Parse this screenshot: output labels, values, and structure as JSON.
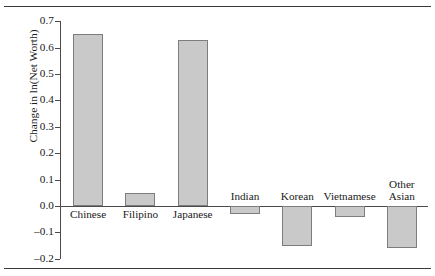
{
  "chart_data": {
    "type": "bar",
    "title": "",
    "subtitle": "",
    "xlabel": "",
    "ylabel": "Change in ln(Net Worth)",
    "categories": [
      "Chinese",
      "Filipino",
      "Japanese",
      "Indian",
      "Korean",
      "Vietnamese",
      "Other Asian"
    ],
    "values": [
      0.65,
      0.05,
      0.63,
      -0.03,
      -0.15,
      -0.04,
      -0.16
    ],
    "ylim": [
      -0.2,
      0.7
    ],
    "ytick_labels": [
      "0.7",
      "0.6",
      "0.5",
      "0.4",
      "0.3",
      "0.2",
      "0.1",
      "0.0",
      "–0.1",
      "–0.2"
    ],
    "ytick_values": [
      0.7,
      0.6,
      0.5,
      0.4,
      0.3,
      0.2,
      0.1,
      0.0,
      -0.1,
      -0.2
    ],
    "grid": false,
    "legend": "none",
    "bar_color": "#c9c9c9",
    "bar_border_color": "#7d7d7d",
    "axis_color": "#4a4a4a",
    "rule_color": "#3a3a3a"
  },
  "labels": {
    "cat_0": "Chinese",
    "cat_1": "Filipino",
    "cat_2": "Japanese",
    "cat_3": "Indian",
    "cat_4": "Korean",
    "cat_5": "Vietnamese",
    "cat_6_line1": "Other",
    "cat_6_line2": "Asian"
  }
}
